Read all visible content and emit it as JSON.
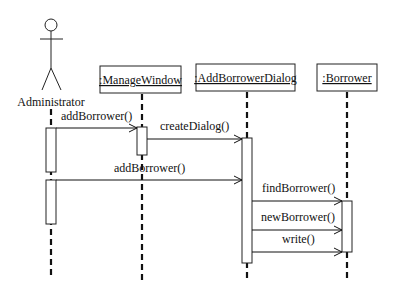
{
  "diagram": {
    "type": "uml-sequence",
    "actor": {
      "label": "Administrator"
    },
    "objects": [
      {
        "id": "mw",
        "label": ":ManageWindow"
      },
      {
        "id": "abd",
        "label": ":AddBorrowerDialog"
      },
      {
        "id": "b",
        "label": ":Borrower"
      }
    ],
    "messages": [
      {
        "label": "addBorrower()",
        "from": "Administrator",
        "to": ":ManageWindow"
      },
      {
        "label": "createDialog()",
        "from": ":ManageWindow",
        "to": ":AddBorrowerDialog"
      },
      {
        "label": "addBorrower()",
        "from": "Administrator",
        "to": ":AddBorrowerDialog"
      },
      {
        "label": "findBorrower()",
        "from": ":AddBorrowerDialog",
        "to": ":Borrower"
      },
      {
        "label": "newBorrower()",
        "from": ":AddBorrowerDialog",
        "to": ":Borrower"
      },
      {
        "label": "write()",
        "from": ":AddBorrowerDialog",
        "to": ":Borrower"
      }
    ],
    "colors": {
      "line": "#111111",
      "background": "#ffffff",
      "activation_fill": "#ffffff"
    }
  }
}
